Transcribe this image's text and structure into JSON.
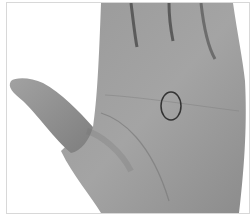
{
  "image": {
    "subject": "palm of a hand",
    "style": "grayscale photograph",
    "annotation": {
      "shape": "ellipse",
      "location": "center of palm",
      "stroke_color": "#333333"
    },
    "colors": {
      "background": "#ffffff",
      "frame_border": "#d8d8d8",
      "skin_light": "#a8a8a8",
      "skin_mid": "#949494",
      "skin_dark": "#6e6e6e",
      "crease": "#4a4a4a"
    }
  }
}
